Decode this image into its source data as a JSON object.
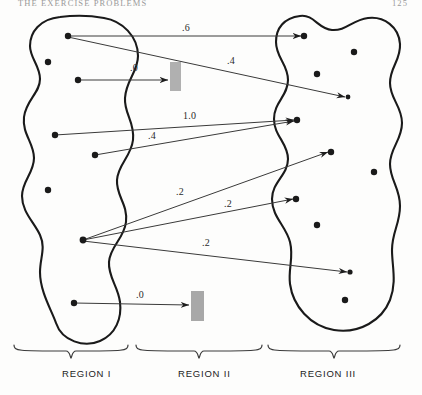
{
  "header": {
    "running_title": "THE EXERCISE PROBLEMS",
    "page_number": "125"
  },
  "figure": {
    "name": "region-transfer-diagram",
    "region_labels": [
      {
        "text": "REGION I",
        "x": 62,
        "y": 368
      },
      {
        "text": "REGION II",
        "x": 178,
        "y": 368
      },
      {
        "text": "REGION III",
        "x": 300,
        "y": 368
      }
    ],
    "braces": [
      {
        "name": "brace-region-i",
        "x1": 14,
        "x2": 128,
        "y": 352
      },
      {
        "name": "brace-region-ii",
        "x1": 136,
        "x2": 262,
        "y": 352
      },
      {
        "name": "brace-region-iii",
        "x1": 268,
        "x2": 400,
        "y": 352
      }
    ],
    "blobs": [
      {
        "name": "region-i-blob",
        "path": "M 60 17 C 40 19 30 32 30 46 C 30 58 40 66 40 79 C 40 93 26 100 24 117 C 22 134 34 143 34 158 C 34 173 22 181 22 196 C 22 212 34 222 40 235 C 46 248 40 258 40 272 C 40 292 52 311 56 323 C 62 341 84 348 100 341 C 116 334 122 318 120 302 C 118 286 108 277 109 262 C 110 246 124 239 126 222 C 128 204 116 196 117 180 C 118 164 131 157 133 140 C 135 122 124 114 125 98 C 126 80 138 72 138 56 C 138 36 122 21 104 18 C 88 15 76 15 60 17 Z"
      },
      {
        "name": "region-iii-blob",
        "path": "M 300 16 C 284 18 276 28 276 42 C 276 58 288 64 288 80 C 288 96 274 102 274 119 C 274 136 288 143 288 159 C 288 175 272 182 272 199 C 272 217 286 226 290 242 C 294 258 288 268 290 284 C 293 306 310 326 334 330 C 360 334 382 320 390 300 C 397 282 392 266 392 250 C 392 232 400 224 400 206 C 400 188 390 180 390 164 C 390 148 402 140 402 123 C 402 106 390 99 390 83 C 390 67 401 60 400 44 C 399 27 384 16 368 18 C 352 20 346 31 332 30 C 318 29 314 14 300 16 Z"
      }
    ],
    "nodes_left": [
      {
        "name": "left-node-1",
        "x": 68,
        "y": 36,
        "r": 3.2
      },
      {
        "name": "left-node-2",
        "x": 48,
        "y": 62,
        "r": 3.2
      },
      {
        "name": "left-node-3",
        "x": 78,
        "y": 80,
        "r": 3.2
      },
      {
        "name": "left-node-4",
        "x": 55,
        "y": 135,
        "r": 3.2
      },
      {
        "name": "left-node-5",
        "x": 95,
        "y": 155,
        "r": 3.2
      },
      {
        "name": "left-node-6",
        "x": 48,
        "y": 190,
        "r": 3.2
      },
      {
        "name": "left-node-7",
        "x": 83,
        "y": 240,
        "r": 3.4
      },
      {
        "name": "left-node-8",
        "x": 74,
        "y": 303,
        "r": 3.2
      }
    ],
    "nodes_right": [
      {
        "name": "right-node-1",
        "x": 304,
        "y": 36,
        "r": 3.2
      },
      {
        "name": "right-node-2",
        "x": 354,
        "y": 52,
        "r": 3.2
      },
      {
        "name": "right-node-3",
        "x": 317,
        "y": 74,
        "r": 3.2
      },
      {
        "name": "right-node-4",
        "x": 348,
        "y": 97,
        "r": 2.4
      },
      {
        "name": "right-node-5",
        "x": 297,
        "y": 120,
        "r": 3.2
      },
      {
        "name": "right-node-6",
        "x": 331,
        "y": 152,
        "r": 3.2
      },
      {
        "name": "right-node-7",
        "x": 374,
        "y": 172,
        "r": 3.2
      },
      {
        "name": "right-node-8",
        "x": 296,
        "y": 199,
        "r": 3.2
      },
      {
        "name": "right-node-9",
        "x": 317,
        "y": 225,
        "r": 3.2
      },
      {
        "name": "right-node-10",
        "x": 350,
        "y": 272,
        "r": 2.6
      },
      {
        "name": "right-node-11",
        "x": 345,
        "y": 300,
        "r": 3.2
      }
    ],
    "bars": [
      {
        "name": "region-ii-bar-top",
        "x": 170,
        "y": 62,
        "w": 11,
        "h": 29,
        "color": "#b0b0b0"
      },
      {
        "name": "region-ii-bar-bottom",
        "x": 191,
        "y": 291,
        "w": 13,
        "h": 30,
        "color": "#a8a8a8"
      }
    ],
    "arrows": [
      {
        "name": "arrow-0-6",
        "value": ".6",
        "x1": 68,
        "y1": 36,
        "x2": 301,
        "y2": 36,
        "label_x": 182,
        "label_y": 22
      },
      {
        "name": "arrow-0-4",
        "value": ".4",
        "x1": 68,
        "y1": 37,
        "x2": 345,
        "y2": 97,
        "label_x": 227,
        "label_y": 55
      },
      {
        "name": "arrow-0-0a",
        "value": ".0",
        "x1": 78,
        "y1": 80,
        "x2": 168,
        "y2": 80,
        "label_x": 130,
        "label_y": 62
      },
      {
        "name": "arrow-1-0",
        "value": "1.0",
        "x1": 55,
        "y1": 135,
        "x2": 294,
        "y2": 120,
        "label_x": 183,
        "label_y": 110
      },
      {
        "name": "arrow-0-4b",
        "value": ".4",
        "x1": 95,
        "y1": 155,
        "x2": 294,
        "y2": 121,
        "label_x": 148,
        "label_y": 130
      },
      {
        "name": "arrow-0-2a",
        "value": ".2",
        "x1": 83,
        "y1": 240,
        "x2": 328,
        "y2": 152,
        "label_x": 176,
        "label_y": 186
      },
      {
        "name": "arrow-0-2b",
        "value": ".2",
        "x1": 83,
        "y1": 240,
        "x2": 293,
        "y2": 199,
        "label_x": 224,
        "label_y": 198
      },
      {
        "name": "arrow-0-2c",
        "value": ".2",
        "x1": 83,
        "y1": 241,
        "x2": 347,
        "y2": 272,
        "label_x": 202,
        "label_y": 237
      },
      {
        "name": "arrow-0-0b",
        "value": ".0",
        "x1": 74,
        "y1": 303,
        "x2": 189,
        "y2": 305,
        "label_x": 136,
        "label_y": 289
      }
    ]
  },
  "colors": {
    "ink": "#1a1a1a",
    "line": "#3a3a3a",
    "bar": "#b0b0b0",
    "paper": "#fdfdfc"
  }
}
